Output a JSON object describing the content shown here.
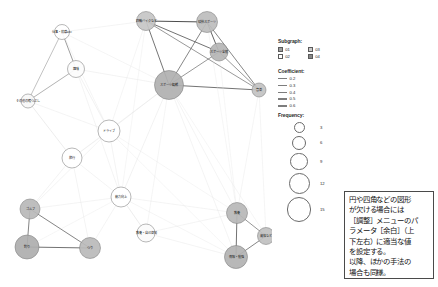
{
  "graph": {
    "type": "co-occurrence-network",
    "nodes": [
      {
        "id": "n1",
        "label": "仕事・就職etc",
        "x": 62,
        "y": 32,
        "r": 7.5,
        "fill": "#ffffff",
        "freq": 3
      },
      {
        "id": "n2",
        "label": "趣味",
        "x": 76,
        "y": 69,
        "r": 8.5,
        "fill": "#fcfcfc",
        "freq": 4
      },
      {
        "id": "n3",
        "label": "その他の暇つぶし",
        "x": 28,
        "y": 101,
        "r": 7.0,
        "fill": "#f7f7f7",
        "freq": 3
      },
      {
        "id": "n4",
        "label": "ドライブ",
        "x": 109,
        "y": 131,
        "r": 11.0,
        "fill": "#ffffff",
        "freq": 6
      },
      {
        "id": "n5",
        "label": "旅行",
        "x": 72,
        "y": 158,
        "r": 10.0,
        "fill": "#ffffff",
        "freq": 5
      },
      {
        "id": "n6",
        "label": "四輪バイクなど",
        "x": 146,
        "y": 21,
        "r": 9.5,
        "fill": "#c5c5c5",
        "freq": 6
      },
      {
        "id": "n7",
        "label": "球技スポーツ",
        "x": 207,
        "y": 22,
        "r": 10.5,
        "fill": "#bdbdbd",
        "freq": 7
      },
      {
        "id": "n8",
        "label": "スポーツ全般",
        "x": 219,
        "y": 52,
        "r": 9.0,
        "fill": "#b5b5b5",
        "freq": 6
      },
      {
        "id": "n9",
        "label": "スポーツ観戦",
        "x": 169,
        "y": 85,
        "r": 14.5,
        "fill": "#b0b0b0",
        "freq": 12
      },
      {
        "id": "n10",
        "label": "音楽",
        "x": 259,
        "y": 90,
        "r": 7.0,
        "fill": "#c2c2c2",
        "freq": 3
      },
      {
        "id": "n11",
        "label": "能力向上",
        "x": 121,
        "y": 197,
        "r": 10.0,
        "fill": "#ffffff",
        "freq": 5
      },
      {
        "id": "n12",
        "label": "教養・自己啓発",
        "x": 146,
        "y": 233,
        "r": 9.0,
        "fill": "#fbfbfb",
        "freq": 4
      },
      {
        "id": "n13",
        "label": "ゴルフ",
        "x": 30,
        "y": 209,
        "r": 10.0,
        "fill": "#b8b8b8",
        "freq": 6
      },
      {
        "id": "n14",
        "label": "釣り",
        "x": 27,
        "y": 247,
        "r": 12.0,
        "fill": "#aeaeae",
        "freq": 9
      },
      {
        "id": "n15",
        "label": "つり",
        "x": 90,
        "y": 248,
        "r": 10.5,
        "fill": "#bababa",
        "freq": 7
      },
      {
        "id": "n16",
        "label": "教養",
        "x": 237,
        "y": 213,
        "r": 10.5,
        "fill": "#b7b7b7",
        "freq": 7
      },
      {
        "id": "n17",
        "label": "資格など",
        "x": 266,
        "y": 236,
        "r": 8.5,
        "fill": "#c0c0c0",
        "freq": 4
      },
      {
        "id": "n18",
        "label": "情報・勉強",
        "x": 236,
        "y": 257,
        "r": 11.5,
        "fill": "#b2b2b2",
        "freq": 9
      }
    ],
    "edges": [
      {
        "from": "n6",
        "to": "n7",
        "w": 0.6,
        "c": "#3f3f3f"
      },
      {
        "from": "n6",
        "to": "n8",
        "w": 0.5,
        "c": "#4a4a4a"
      },
      {
        "from": "n6",
        "to": "n9",
        "w": 0.5,
        "c": "#4d4d4d"
      },
      {
        "from": "n6",
        "to": "n10",
        "w": 0.4,
        "c": "#5a5a5a"
      },
      {
        "from": "n7",
        "to": "n8",
        "w": 0.55,
        "c": "#464646"
      },
      {
        "from": "n7",
        "to": "n9",
        "w": 0.45,
        "c": "#515151"
      },
      {
        "from": "n7",
        "to": "n10",
        "w": 0.45,
        "c": "#515151"
      },
      {
        "from": "n8",
        "to": "n9",
        "w": 0.4,
        "c": "#585858"
      },
      {
        "from": "n8",
        "to": "n10",
        "w": 0.4,
        "c": "#585858"
      },
      {
        "from": "n9",
        "to": "n10",
        "w": 0.5,
        "c": "#4b4b4b"
      },
      {
        "from": "n1",
        "to": "n2",
        "w": 0.4,
        "c": "#626262"
      },
      {
        "from": "n1",
        "to": "n3",
        "w": 0.3,
        "c": "#7a7a7a"
      },
      {
        "from": "n2",
        "to": "n3",
        "w": 0.35,
        "c": "#707070"
      },
      {
        "from": "n13",
        "to": "n14",
        "w": 0.45,
        "c": "#4f4f4f"
      },
      {
        "from": "n13",
        "to": "n15",
        "w": 0.45,
        "c": "#4f4f4f"
      },
      {
        "from": "n14",
        "to": "n15",
        "w": 0.5,
        "c": "#4a4a4a"
      },
      {
        "from": "n16",
        "to": "n17",
        "w": 0.4,
        "c": "#565656"
      },
      {
        "from": "n16",
        "to": "n18",
        "w": 0.5,
        "c": "#4a4a4a"
      },
      {
        "from": "n17",
        "to": "n18",
        "w": 0.45,
        "c": "#505050"
      },
      {
        "from": "n2",
        "to": "n4",
        "w": 0.2,
        "c": "#d3d3d3"
      },
      {
        "from": "n2",
        "to": "n9",
        "w": 0.2,
        "c": "#d8d8d8"
      },
      {
        "from": "n1",
        "to": "n6",
        "w": 0.2,
        "c": "#dcdcdc"
      },
      {
        "from": "n1",
        "to": "n9",
        "w": 0.2,
        "c": "#dedede"
      },
      {
        "from": "n3",
        "to": "n4",
        "w": 0.2,
        "c": "#dadada"
      },
      {
        "from": "n4",
        "to": "n9",
        "w": 0.2,
        "c": "#d6d6d6"
      },
      {
        "from": "n4",
        "to": "n11",
        "w": 0.2,
        "c": "#d9d9d9"
      },
      {
        "from": "n4",
        "to": "n5",
        "w": 0.2,
        "c": "#dbdbdb"
      },
      {
        "from": "n5",
        "to": "n13",
        "w": 0.2,
        "c": "#d7d7d7"
      },
      {
        "from": "n5",
        "to": "n11",
        "w": 0.2,
        "c": "#dcdcdc"
      },
      {
        "from": "n11",
        "to": "n12",
        "w": 0.25,
        "c": "#cfcfcf"
      },
      {
        "from": "n11",
        "to": "n16",
        "w": 0.2,
        "c": "#dcdcdc"
      },
      {
        "from": "n11",
        "to": "n18",
        "w": 0.2,
        "c": "#dedede"
      },
      {
        "from": "n12",
        "to": "n16",
        "w": 0.2,
        "c": "#dadada"
      },
      {
        "from": "n12",
        "to": "n18",
        "w": 0.2,
        "c": "#dcdcdc"
      },
      {
        "from": "n13",
        "to": "n11",
        "w": 0.2,
        "c": "#dadada"
      },
      {
        "from": "n15",
        "to": "n11",
        "w": 0.2,
        "c": "#dcdcdc"
      },
      {
        "from": "n9",
        "to": "n11",
        "w": 0.2,
        "c": "#d5d5d5"
      },
      {
        "from": "n9",
        "to": "n16",
        "w": 0.2,
        "c": "#dadada"
      },
      {
        "from": "n9",
        "to": "n18",
        "w": 0.2,
        "c": "#dcdcdc"
      },
      {
        "from": "n10",
        "to": "n16",
        "w": 0.2,
        "c": "#dedede"
      },
      {
        "from": "n10",
        "to": "n17",
        "w": 0.2,
        "c": "#dedede"
      },
      {
        "from": "n2",
        "to": "n11",
        "w": 0.2,
        "c": "#dcdcdc"
      },
      {
        "from": "n3",
        "to": "n5",
        "w": 0.25,
        "c": "#cfcfcf"
      },
      {
        "from": "n1",
        "to": "n4",
        "w": 0.2,
        "c": "#dddddd"
      },
      {
        "from": "n6",
        "to": "n4",
        "w": 0.2,
        "c": "#dddddd"
      },
      {
        "from": "n6",
        "to": "n11",
        "w": 0.2,
        "c": "#e0e0e0"
      },
      {
        "from": "n7",
        "to": "n16",
        "w": 0.2,
        "c": "#e0e0e0"
      },
      {
        "from": "n8",
        "to": "n16",
        "w": 0.2,
        "c": "#e0e0e0"
      },
      {
        "from": "n5",
        "to": "n15",
        "w": 0.2,
        "c": "#dcdcdc"
      },
      {
        "from": "n5",
        "to": "n9",
        "w": 0.2,
        "c": "#dedede"
      },
      {
        "from": "n13",
        "to": "n4",
        "w": 0.2,
        "c": "#dcdcdc"
      },
      {
        "from": "n14",
        "to": "n11",
        "w": 0.2,
        "c": "#e0e0e0"
      },
      {
        "from": "n16",
        "to": "n4",
        "w": 0.2,
        "c": "#e2e2e2"
      },
      {
        "from": "n18",
        "to": "n4",
        "w": 0.2,
        "c": "#e2e2e2"
      },
      {
        "from": "n12",
        "to": "n9",
        "w": 0.2,
        "c": "#dedede"
      },
      {
        "from": "n17",
        "to": "n9",
        "w": 0.2,
        "c": "#e2e2e2"
      }
    ]
  },
  "legend": {
    "subgraph": {
      "title": "Subgraph:",
      "items": [
        {
          "label": "01",
          "fill": "#9e9e9e",
          "checked": true
        },
        {
          "label": "03",
          "fill": "#c9c9c9",
          "checked": true
        },
        {
          "label": "02",
          "fill": "#ffffff",
          "checked": false
        },
        {
          "label": "04",
          "fill": "#888888",
          "checked": true
        }
      ]
    },
    "coefficient": {
      "title": "Coefficient:",
      "items": [
        {
          "label": "0.2",
          "weight": 0.5
        },
        {
          "label": "0.3",
          "weight": 0.8
        },
        {
          "label": "0.4",
          "weight": 1.1
        },
        {
          "label": "0.5",
          "weight": 1.5
        },
        {
          "label": "0.6",
          "weight": 1.9
        }
      ]
    },
    "frequency": {
      "title": "Frequency:",
      "items": [
        {
          "label": "3",
          "d": 11
        },
        {
          "label": "6",
          "d": 14
        },
        {
          "label": "9",
          "d": 17.5
        },
        {
          "label": "12",
          "d": 21
        },
        {
          "label": "15",
          "d": 24.5
        }
      ]
    }
  },
  "note": {
    "lines": [
      "円や四角などの図形",
      "が欠ける場合には",
      "［調整］メニューのパ",
      "ラメータ［余白］（上",
      "下左右）に適当な値",
      "を設定する。",
      "以降、ほかの手法の",
      "場合も同様。"
    ]
  }
}
